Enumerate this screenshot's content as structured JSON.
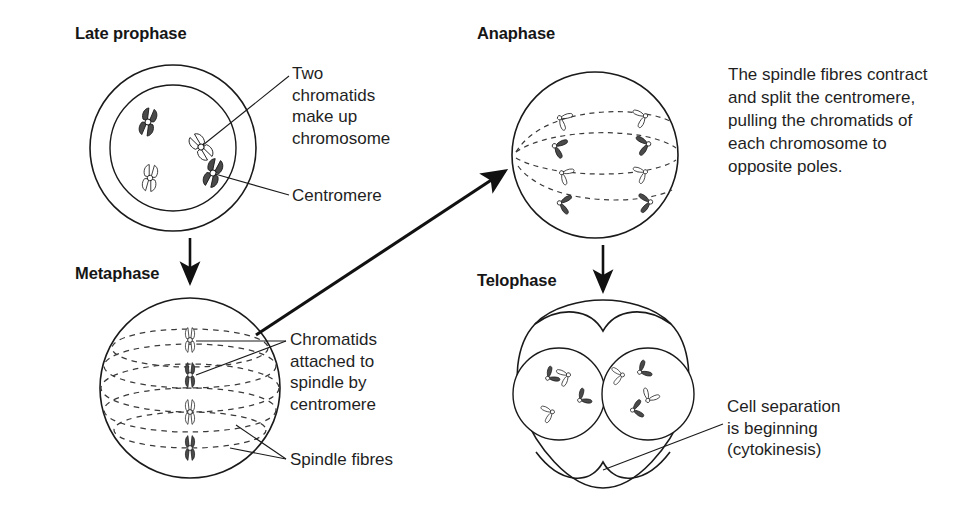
{
  "diagram": {
    "title_semantic": "stages-of-mitosis",
    "background_color": "#ffffff",
    "ink_color": "#1a1a1a",
    "chromosome_dark_fill": "#4a4a4a",
    "chromosome_light_fill": "#ffffff"
  },
  "stages": [
    {
      "id": "late-prophase",
      "heading": "Late prophase"
    },
    {
      "id": "metaphase",
      "heading": "Metaphase"
    },
    {
      "id": "anaphase",
      "heading": "Anaphase"
    },
    {
      "id": "telophase",
      "heading": "Telophase"
    }
  ],
  "labels": {
    "two_chromatids": "Two\nchromatids\nmake up\nchromosome",
    "centromere": "Centromere",
    "chromatids_attached": "Chromatids\nattached to\nspindle by\ncentromere",
    "spindle_fibres": "Spindle fibres",
    "cell_separation": "Cell separation\nis beginning\n(cytokinesis)"
  },
  "paragraphs": {
    "anaphase_description": "The spindle fibres contract and split the centromere, pulling the chromatids of each chromosome to opposite poles."
  },
  "arrows": [
    {
      "id": "prophase-to-metaphase",
      "direction": "down"
    },
    {
      "id": "metaphase-to-anaphase",
      "direction": "diagonal-up-right"
    },
    {
      "id": "anaphase-to-telophase",
      "direction": "down"
    }
  ],
  "counts": {
    "prophase_chromosomes": 4,
    "metaphase_chromosomes": 4,
    "anaphase_chromatids_per_pole": 4,
    "telophase_nuclei": 2,
    "telophase_chromatids_per_nucleus": 4
  }
}
